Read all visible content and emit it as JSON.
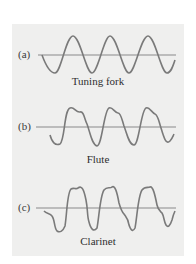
{
  "figure": {
    "panels": [
      {
        "tag": "(a)",
        "caption": "Tuning fork",
        "waveform": "pure sine"
      },
      {
        "tag": "(b)",
        "caption": "Flute",
        "waveform": "sine with harmonic shoulder"
      },
      {
        "tag": "(c)",
        "caption": "Clarinet",
        "waveform": "complex with strong harmonics"
      }
    ],
    "colors": {
      "panel_bg": "#efefee",
      "wave": "#7a7a7a",
      "axis": "#8a8a8a",
      "text": "#333333"
    }
  }
}
